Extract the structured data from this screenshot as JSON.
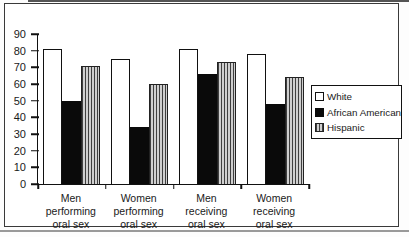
{
  "chart_data": {
    "type": "bar",
    "title": "",
    "xlabel": "",
    "ylabel": "",
    "ylim": [
      0,
      90
    ],
    "yticks": [
      0,
      10,
      20,
      30,
      40,
      50,
      60,
      70,
      80,
      90
    ],
    "grid": false,
    "legend_position": "right",
    "categories": [
      "Men performing oral sex",
      "Women performing oral sex",
      "Men receiving oral sex",
      "Women receiving oral sex"
    ],
    "category_label_lines": [
      [
        "Men",
        "performing",
        "oral sex"
      ],
      [
        "Women",
        "performing",
        "oral sex"
      ],
      [
        "Men",
        "receiving",
        "oral sex"
      ],
      [
        "Women",
        "receiving",
        "oral sex"
      ]
    ],
    "series": [
      {
        "name": "White",
        "style": "white",
        "values": [
          81,
          75,
          81,
          78
        ]
      },
      {
        "name": "African American",
        "style": "black",
        "values": [
          50,
          34,
          66,
          48
        ]
      },
      {
        "name": "Hispanic",
        "style": "striped",
        "values": [
          71,
          60,
          73,
          64
        ]
      }
    ],
    "colors": {
      "bar_white_fill": "#ffffff",
      "bar_black_fill": "#0a0a0a",
      "bar_striped_fill": "#cfcfcf",
      "bar_striped_stripe": "#3f3f3f",
      "axis": "#111111",
      "frame_border": "#3a3a3a"
    }
  }
}
